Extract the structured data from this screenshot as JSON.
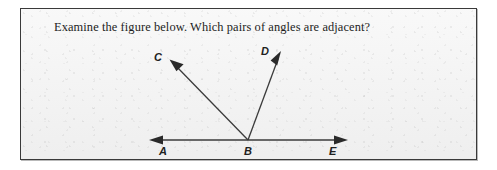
{
  "card": {
    "prompt": "Examine the figure below. Which pairs of angles are adjacent?",
    "background_color": "#f1f1f1",
    "border_color": "#3a3a3a"
  },
  "figure": {
    "name": "adjacent-angles-diagram",
    "stroke_color": "#3b3b3b",
    "vertex_label": "B",
    "labels": {
      "C": "C",
      "D": "D",
      "A": "A",
      "B": "B",
      "E": "E"
    },
    "rays": [
      {
        "id": "ray-BA",
        "from": "B",
        "to": "A",
        "direction": "left"
      },
      {
        "id": "ray-BE",
        "from": "B",
        "to": "E",
        "direction": "right"
      },
      {
        "id": "ray-BC",
        "from": "B",
        "to": "C",
        "direction": "up-left"
      },
      {
        "id": "ray-BD",
        "from": "B",
        "to": "D",
        "direction": "up-right"
      }
    ]
  }
}
